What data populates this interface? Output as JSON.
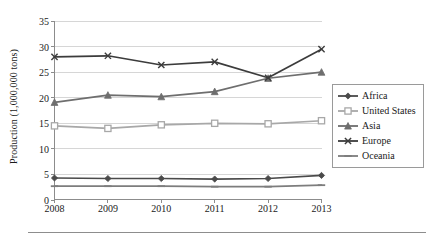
{
  "chart_data": {
    "type": "line",
    "title": "",
    "xlabel": "",
    "ylabel": "Production (1,000,000 tons)",
    "categories": [
      "2008",
      "2009",
      "2010",
      "2011",
      "2012",
      "2013"
    ],
    "x": [
      2008,
      2009,
      2010,
      2011,
      2012,
      2013
    ],
    "ylim": [
      0,
      35
    ],
    "yticks": [
      0,
      5,
      10,
      15,
      20,
      25,
      30,
      35
    ],
    "ytick_labels": [
      "0",
      "5",
      "10",
      "15",
      "20",
      "25",
      "30",
      "35"
    ],
    "grid": "horizontal",
    "legend_position": "right",
    "series": [
      {
        "name": "Africa",
        "color": "#4a4a4a",
        "marker": "diamond",
        "values": [
          4.3,
          4.2,
          4.2,
          4.1,
          4.2,
          4.8
        ]
      },
      {
        "name": "United States",
        "color": "#a8a8a8",
        "marker": "square",
        "values": [
          14.5,
          14.0,
          14.7,
          15.0,
          14.9,
          15.5
        ]
      },
      {
        "name": "Asia",
        "color": "#6e6e6e",
        "marker": "triangle",
        "values": [
          19.1,
          20.5,
          20.2,
          21.2,
          23.8,
          25.0
        ]
      },
      {
        "name": "Europe",
        "color": "#3c3c3c",
        "marker": "cross",
        "values": [
          28.0,
          28.2,
          26.4,
          27.0,
          23.9,
          29.5
        ]
      },
      {
        "name": "Oceania",
        "color": "#7d7d7d",
        "marker": "line",
        "values": [
          2.7,
          2.7,
          2.7,
          2.6,
          2.6,
          2.9
        ]
      }
    ]
  },
  "axis": {
    "y_title": "Production (1,000,000 tons)"
  },
  "legend": {
    "entries": [
      "Africa",
      "United States",
      "Asia",
      "Europe",
      "Oceania"
    ]
  }
}
